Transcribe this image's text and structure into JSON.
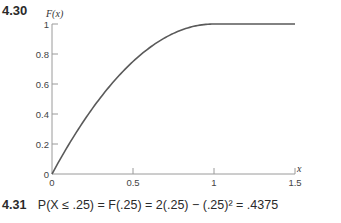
{
  "problem_top": {
    "number": "4.30"
  },
  "problem_bottom": {
    "number": "4.31",
    "equation": "P(X ≤ .25) = F(.25) = 2(.25) − (.25)² = .4375"
  },
  "chart_data": {
    "type": "line",
    "title": "",
    "xlabel": "x",
    "ylabel": "F(x)",
    "xlim": [
      0,
      1.5
    ],
    "ylim": [
      0,
      1
    ],
    "x_ticks": [
      0,
      0.5,
      1,
      1.5
    ],
    "x_tick_labels": [
      "0",
      "0.5",
      "1",
      "1.5"
    ],
    "y_ticks": [
      0,
      0.2,
      0.4,
      0.6,
      0.8,
      1
    ],
    "y_tick_labels": [
      "0",
      "0.2",
      "0.4",
      "0.6",
      "0.8",
      "1"
    ],
    "grid": false,
    "legend": "none",
    "series": [
      {
        "name": "F(x)",
        "function": "F(x) = 2x - x^2 for 0 <= x <= 1; F(x) = 1 for x > 1",
        "x": [
          0,
          0.1,
          0.2,
          0.3,
          0.4,
          0.5,
          0.6,
          0.7,
          0.8,
          0.9,
          1.0,
          1.1,
          1.2,
          1.3,
          1.4,
          1.5
        ],
        "y": [
          0,
          0.19,
          0.36,
          0.51,
          0.64,
          0.75,
          0.84,
          0.91,
          0.96,
          0.99,
          1.0,
          1.0,
          1.0,
          1.0,
          1.0,
          1.0
        ]
      }
    ]
  }
}
